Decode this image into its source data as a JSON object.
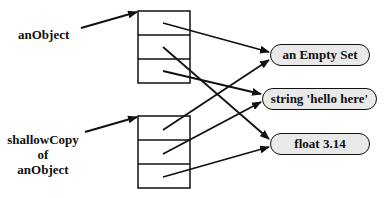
{
  "diagram": {
    "labels": {
      "original": "anObject",
      "copy_line1": "shallowCopy",
      "copy_line2": "of",
      "copy_line3": "anObject"
    },
    "objects": [
      {
        "id": "empty-set",
        "label": "an Empty Set"
      },
      {
        "id": "string",
        "label": "string 'hello here'"
      },
      {
        "id": "float",
        "label": "float 3.14"
      }
    ],
    "boxes": [
      {
        "id": "anObject",
        "slots": 3,
        "slot_targets": [
          "an Empty Set",
          "float 3.14",
          "string 'hello here'"
        ]
      },
      {
        "id": "shallowCopy",
        "slots": 3,
        "slot_targets": [
          "an Empty Set",
          "string 'hello here'",
          "float 3.14"
        ]
      }
    ],
    "colors": {
      "stroke": "#111111",
      "pill_fill": "#e9e9e9",
      "background": "#ffffff"
    }
  }
}
